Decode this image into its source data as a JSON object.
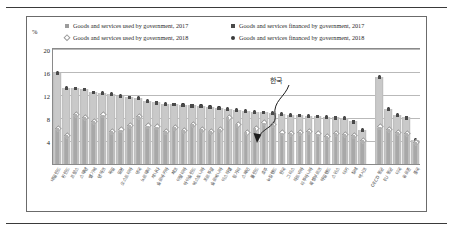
{
  "chart_data": {
    "type": "bar",
    "title": "",
    "xlabel": "",
    "ylabel": "%",
    "ylim": [
      0,
      20
    ],
    "yticks": [
      4,
      8,
      12,
      16,
      20
    ],
    "grid": true,
    "legend_position": "top",
    "annotation": {
      "text": "한국",
      "points_to": "Korea"
    },
    "legend": [
      {
        "label": "Goods and services used by government, 2017",
        "marker": "square-light"
      },
      {
        "label": "Goods and services used by government, 2018",
        "marker": "diamond-open-light"
      },
      {
        "label": "Goods and services financed by government, 2017",
        "marker": "square-dark"
      },
      {
        "label": "Goods and services financed by government, 2018",
        "marker": "circle-dark"
      }
    ],
    "categories": [
      "네덜란드",
      "핀란드",
      "프랑스",
      "스웨덴",
      "벨기에",
      "덴마크",
      "독일",
      "일본",
      "오스트리아",
      "영국",
      "노르웨이",
      "캐나다",
      "슬로바키아",
      "체코",
      "이탈리아",
      "아이슬란드",
      "에스토니아",
      "포르투갈",
      "슬로베니아",
      "이스라엘",
      "헝가리",
      "스페인",
      "폴란드",
      "호주",
      "뉴질랜드",
      "한국",
      "그리스",
      "라트비아",
      "리투아니아",
      "룩셈부르크",
      "아일랜드",
      "스위스",
      "터키",
      "칠레",
      "멕시코",
      "",
      "OECD 평균",
      "EU 평균",
      "미국",
      "유로존",
      "중국"
    ],
    "series": [
      {
        "name": "Goods and services financed by government, 2018",
        "marker": "circle-dark",
        "values": [
          15.9,
          13.3,
          13.2,
          13.0,
          12.5,
          12.4,
          12.2,
          11.9,
          11.6,
          11.5,
          11.0,
          10.7,
          10.5,
          10.4,
          10.3,
          10.2,
          10.1,
          9.9,
          9.8,
          9.6,
          9.4,
          9.3,
          9.1,
          9.0,
          8.9,
          8.7,
          8.6,
          8.5,
          8.4,
          8.3,
          8.2,
          8.1,
          8.0,
          7.4,
          5.9,
          null,
          15.2,
          9.6,
          8.6,
          8.1,
          4.2
        ]
      },
      {
        "name": "Goods and services financed by government, 2017",
        "marker": "square-dark",
        "values": [
          15.7,
          13.2,
          13.1,
          12.9,
          12.4,
          12.3,
          12.1,
          11.8,
          11.5,
          11.4,
          10.9,
          10.6,
          10.4,
          10.3,
          10.2,
          10.1,
          10.0,
          9.8,
          9.7,
          9.5,
          9.3,
          9.2,
          9.0,
          8.9,
          8.8,
          8.6,
          8.5,
          8.4,
          8.3,
          8.2,
          8.1,
          8.0,
          7.9,
          7.3,
          5.8,
          null,
          15.0,
          9.5,
          8.5,
          8.0,
          4.1
        ]
      },
      {
        "name": "Goods and services used by government, 2018",
        "marker": "diamond-open-light",
        "values": [
          6.1,
          4.9,
          8.5,
          8.0,
          7.3,
          8.4,
          5.5,
          5.8,
          6.6,
          8.2,
          6.5,
          6.3,
          5.5,
          6.2,
          5.7,
          6.8,
          5.9,
          5.6,
          5.9,
          8.0,
          6.7,
          5.4,
          6.1,
          7.0,
          6.8,
          5.3,
          5.2,
          5.4,
          5.5,
          5.1,
          4.7,
          5.2,
          5.0,
          4.8,
          4.0,
          null,
          6.3,
          5.9,
          5.4,
          5.2,
          3.6
        ]
      },
      {
        "name": "Goods and services used by government, 2017",
        "marker": "square-light",
        "values": [
          6.0,
          4.8,
          8.4,
          7.9,
          7.2,
          8.3,
          5.4,
          5.7,
          6.5,
          8.1,
          6.4,
          6.2,
          5.4,
          6.1,
          5.6,
          6.7,
          5.8,
          5.5,
          5.8,
          7.9,
          6.6,
          5.3,
          6.0,
          6.9,
          6.7,
          5.2,
          5.1,
          5.3,
          5.4,
          5.0,
          4.6,
          5.1,
          4.9,
          4.7,
          3.9,
          null,
          6.2,
          5.8,
          5.3,
          5.1,
          3.5
        ]
      }
    ],
    "bar_values": [
      15.9,
      13.3,
      13.2,
      13.0,
      12.5,
      12.4,
      12.2,
      11.9,
      11.6,
      11.5,
      11.0,
      10.7,
      10.5,
      10.4,
      10.3,
      10.2,
      10.1,
      9.9,
      9.8,
      9.6,
      9.4,
      9.3,
      9.1,
      9.0,
      8.9,
      8.7,
      8.6,
      8.5,
      8.4,
      8.3,
      8.2,
      8.1,
      8.0,
      7.4,
      5.9,
      null,
      15.2,
      9.6,
      8.6,
      8.1,
      4.2
    ],
    "colors": {
      "bar_light": "#c9c9c9",
      "bar_mid": "#a8a8a8",
      "marker_dark": "#3a3a3a",
      "marker_light": "#9c9c9c",
      "grid": "#b9b9b9",
      "frame": "#6b6b6b"
    }
  }
}
